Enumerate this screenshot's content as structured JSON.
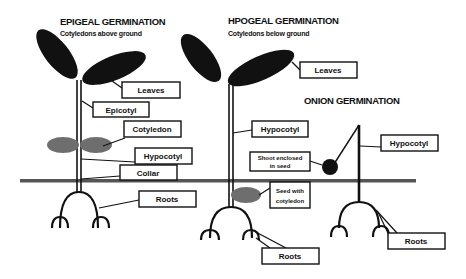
{
  "diagram": {
    "colors": {
      "ink": "#111111",
      "ground": "#555555",
      "cotyledon": "#6e6e6e",
      "background": "#ffffff"
    },
    "epigeal": {
      "title": "EPIGEAL GERMINATION",
      "subtitle": "Cotyledons above ground",
      "labels": {
        "leaves": "Leaves",
        "epicotyl": "Epicotyl",
        "cotyledon": "Cotyledon",
        "hypocotyl": "Hypocotyl",
        "collar": "Collar",
        "roots": "Roots"
      }
    },
    "hypogeal": {
      "title": "HPOGEAL GERMINATION",
      "subtitle": "Cotyledons below ground",
      "labels": {
        "leaves": "Leaves",
        "hypocotyl": "Hypocotyl",
        "seed_line1": "Seed with",
        "seed_line2": "cotyledon",
        "roots": "Roots"
      }
    },
    "onion": {
      "title": "ONION GERMINATION",
      "labels": {
        "shoot_line1": "Shoot enclosed",
        "shoot_line2": "in seed",
        "hypocotyl": "Hypocotyl",
        "roots": "Roots"
      }
    }
  }
}
